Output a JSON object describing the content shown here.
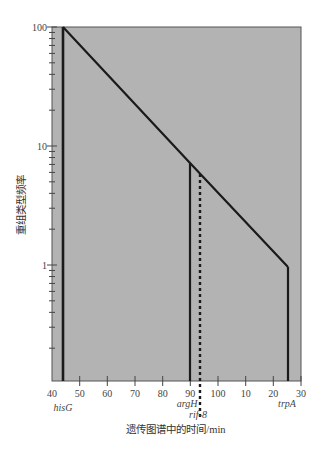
{
  "chart_data": {
    "type": "line",
    "title": "",
    "xlabel": "遗传图谱中的时间/min",
    "ylabel": "重组类型频率",
    "yscale": "log",
    "ylim": [
      0.106,
      100
    ],
    "xlim": [
      40,
      130
    ],
    "x_tick_values": [
      40,
      50,
      60,
      70,
      80,
      90,
      100,
      110,
      120,
      130
    ],
    "x_tick_labels": [
      "40",
      "50",
      "60",
      "70",
      "80",
      "90",
      "100",
      "10",
      "20",
      "30"
    ],
    "y_tick_labels": [
      "100",
      "10",
      "1"
    ],
    "y_tick_values": [
      100,
      10,
      1
    ],
    "grid": false,
    "background_color": "#b3b3b3",
    "line_color": "#1a1a1a",
    "series": [
      {
        "name": "重组类型频率梯度",
        "style": "solid",
        "x": [
          44,
          90,
          125
        ],
        "values": [
          100,
          7.2,
          0.95
        ]
      }
    ],
    "markers": [
      {
        "name": "hisG",
        "x": 44,
        "top_value": 100,
        "style": "solid"
      },
      {
        "name": "argH",
        "x": 90,
        "top_value": 7.2,
        "style": "solid"
      },
      {
        "name": "rif-8",
        "x": 93.5,
        "top_value": 5.8,
        "style": "dotted"
      },
      {
        "name": "trpA",
        "x": 125,
        "top_value": 0.95,
        "style": "solid"
      }
    ],
    "annotations": [
      "hisG",
      "argH",
      "rif-8",
      "trpA"
    ]
  },
  "labels": {
    "xlabel": "遗传图谱中的时间/min",
    "ylabel": "重组类型频率",
    "y100": "100",
    "y10": "10",
    "y1": "1",
    "x40": "40",
    "x50": "50",
    "x60": "60",
    "x70": "70",
    "x80": "80",
    "x90": "90",
    "x100": "100",
    "x110": "10",
    "x120": "20",
    "x130": "30",
    "hisG": "hisG",
    "argH": "argH",
    "rif8": "rif-8",
    "trpA": "trpA"
  }
}
